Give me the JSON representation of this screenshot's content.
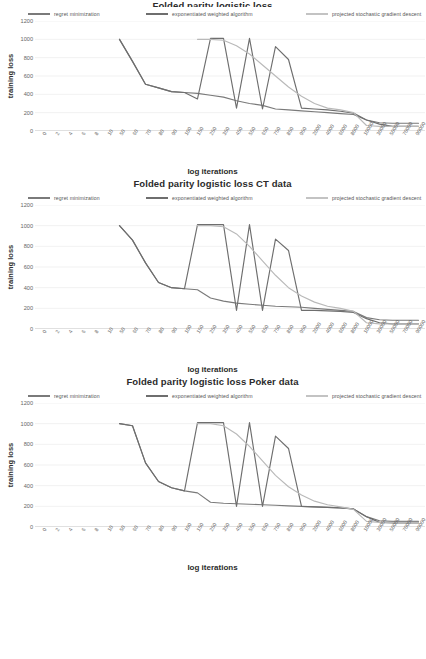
{
  "page": {
    "background": "#ffffff",
    "series_colors": [
      "#7a7a7a",
      "#6e6e6e",
      "#b9b9b9"
    ]
  },
  "legend": {
    "items": [
      {
        "label": "regret minimization",
        "color": "#7a7a7a"
      },
      {
        "label": "exponentiated weighted algorithm",
        "color": "#6e6e6e"
      },
      {
        "label": "projected stochastic gradient descent",
        "color": "#b9b9b9"
      }
    ]
  },
  "axis": {
    "ylabel": "training loss",
    "xlabel": "log iterations",
    "yticks": [
      "0",
      "200",
      "400",
      "600",
      "800",
      "1000",
      "1200"
    ],
    "xticks": [
      "0",
      "2",
      "4",
      "6",
      "8",
      "10",
      "50",
      "60",
      "70",
      "80",
      "90",
      "100",
      "150",
      "250",
      "350",
      "450",
      "550",
      "650",
      "750",
      "850",
      "950",
      "2000",
      "4000",
      "6000",
      "8000",
      "10000",
      "30000",
      "50000",
      "70000",
      "90000"
    ]
  },
  "charts": [
    {
      "title": "Folded parity logistic loss",
      "title_clipped": true
    },
    {
      "title": "Folded parity logistic loss CT data",
      "title_clipped": false
    },
    {
      "title": "Folded parity logistic loss Poker data",
      "title_clipped": false
    }
  ],
  "chart_data": [
    {
      "type": "line",
      "title": "Folded parity logistic loss",
      "xlabel": "log iterations",
      "ylabel": "training loss",
      "ylim": [
        0,
        1200
      ],
      "grid": true,
      "legend_position": "top",
      "x": [
        "0",
        "2",
        "4",
        "6",
        "8",
        "10",
        "50",
        "60",
        "70",
        "80",
        "90",
        "100",
        "150",
        "250",
        "350",
        "450",
        "550",
        "650",
        "750",
        "850",
        "950",
        "2000",
        "4000",
        "6000",
        "8000",
        "10000",
        "30000",
        "50000",
        "70000",
        "90000"
      ],
      "series": [
        {
          "name": "regret minimization",
          "color": "#7a7a7a",
          "values": [
            null,
            null,
            null,
            null,
            null,
            null,
            1000,
            760,
            510,
            470,
            430,
            420,
            410,
            390,
            370,
            330,
            300,
            280,
            240,
            230,
            220,
            210,
            200,
            190,
            180,
            120,
            90,
            85,
            85,
            85
          ]
        },
        {
          "name": "exponentiated weighted algorithm",
          "color": "#6e6e6e",
          "values": [
            null,
            null,
            null,
            null,
            null,
            null,
            1000,
            760,
            510,
            470,
            430,
            420,
            350,
            1010,
            1010,
            250,
            1010,
            240,
            920,
            780,
            250,
            240,
            230,
            215,
            195,
            120,
            75,
            50,
            50,
            50
          ]
        },
        {
          "name": "projected stochastic gradient descent",
          "color": "#b9b9b9",
          "values": [
            null,
            null,
            null,
            null,
            null,
            null,
            null,
            null,
            null,
            null,
            null,
            null,
            1000,
            1000,
            990,
            930,
            840,
            720,
            600,
            480,
            380,
            300,
            250,
            230,
            200,
            60,
            50,
            50,
            50,
            50
          ]
        }
      ]
    },
    {
      "type": "line",
      "title": "Folded parity logistic loss CT data",
      "xlabel": "log iterations",
      "ylabel": "training loss",
      "ylim": [
        0,
        1200
      ],
      "grid": true,
      "legend_position": "top",
      "x": [
        "0",
        "2",
        "4",
        "6",
        "8",
        "10",
        "50",
        "60",
        "70",
        "80",
        "90",
        "100",
        "150",
        "250",
        "350",
        "450",
        "550",
        "650",
        "750",
        "850",
        "950",
        "2000",
        "4000",
        "6000",
        "8000",
        "10000",
        "30000",
        "50000",
        "70000",
        "90000"
      ],
      "series": [
        {
          "name": "regret minimization",
          "color": "#7a7a7a",
          "values": [
            null,
            null,
            null,
            null,
            null,
            null,
            1000,
            860,
            640,
            450,
            400,
            390,
            380,
            300,
            270,
            250,
            240,
            230,
            220,
            215,
            210,
            200,
            190,
            180,
            170,
            110,
            90,
            85,
            85,
            85
          ]
        },
        {
          "name": "exponentiated weighted algorithm",
          "color": "#6e6e6e",
          "values": [
            null,
            null,
            null,
            null,
            null,
            null,
            1000,
            860,
            640,
            450,
            400,
            390,
            1010,
            1010,
            1010,
            180,
            1010,
            180,
            870,
            760,
            180,
            180,
            175,
            170,
            160,
            100,
            60,
            50,
            50,
            50
          ]
        },
        {
          "name": "projected stochastic gradient descent",
          "color": "#b9b9b9",
          "values": [
            null,
            null,
            null,
            null,
            null,
            null,
            null,
            null,
            null,
            null,
            null,
            null,
            1000,
            1000,
            990,
            920,
            800,
            660,
            520,
            400,
            320,
            260,
            220,
            200,
            170,
            60,
            50,
            50,
            50,
            50
          ]
        }
      ]
    },
    {
      "type": "line",
      "title": "Folded parity logistic loss Poker data",
      "xlabel": "log iterations",
      "ylabel": "training loss",
      "ylim": [
        0,
        1200
      ],
      "grid": true,
      "legend_position": "top",
      "x": [
        "0",
        "2",
        "4",
        "6",
        "8",
        "10",
        "50",
        "60",
        "70",
        "80",
        "90",
        "100",
        "150",
        "250",
        "350",
        "450",
        "550",
        "650",
        "750",
        "850",
        "950",
        "2000",
        "4000",
        "6000",
        "8000",
        "10000",
        "30000",
        "50000",
        "70000",
        "90000"
      ],
      "series": [
        {
          "name": "regret minimization",
          "color": "#7a7a7a",
          "values": [
            null,
            null,
            null,
            null,
            null,
            null,
            1000,
            980,
            620,
            440,
            380,
            350,
            330,
            240,
            230,
            225,
            220,
            215,
            210,
            205,
            200,
            195,
            190,
            185,
            175,
            100,
            60,
            55,
            55,
            55
          ]
        },
        {
          "name": "exponentiated weighted algorithm",
          "color": "#6e6e6e",
          "values": [
            null,
            null,
            null,
            null,
            null,
            null,
            1000,
            980,
            620,
            440,
            380,
            350,
            1010,
            1010,
            1010,
            200,
            1010,
            200,
            880,
            760,
            200,
            195,
            190,
            185,
            175,
            100,
            45,
            40,
            40,
            40
          ]
        },
        {
          "name": "projected stochastic gradient descent",
          "color": "#b9b9b9",
          "values": [
            null,
            null,
            null,
            null,
            null,
            null,
            null,
            null,
            null,
            null,
            null,
            null,
            1000,
            1000,
            980,
            900,
            780,
            640,
            500,
            390,
            310,
            250,
            215,
            195,
            170,
            55,
            45,
            45,
            45,
            45
          ]
        }
      ]
    }
  ]
}
